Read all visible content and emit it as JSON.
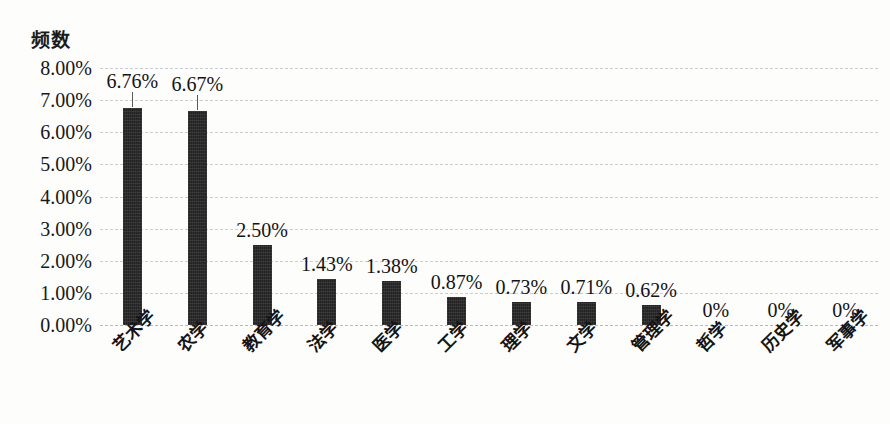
{
  "chart_data": {
    "type": "bar",
    "title": "",
    "ylabel": "频数",
    "xlabel": "",
    "ylim": [
      0,
      8
    ],
    "ytick_labels": [
      "8.00%",
      "7.00%",
      "6.00%",
      "5.00%",
      "4.00%",
      "3.00%",
      "2.00%",
      "1.00%",
      "0.00%"
    ],
    "ytick_values": [
      8,
      7,
      6,
      5,
      4,
      3,
      2,
      1,
      0
    ],
    "grid": true,
    "grid_style": "dashed-horizontal",
    "legend": "none",
    "bar_color": "#232323",
    "categories": [
      "艺术学",
      "农学",
      "教育学",
      "法学",
      "医学",
      "工学",
      "理学",
      "文学",
      "管理学",
      "哲学",
      "历史学",
      "军事学"
    ],
    "values": [
      6.76,
      6.67,
      2.5,
      1.43,
      1.38,
      0.87,
      0.73,
      0.71,
      0.62,
      0,
      0,
      0
    ],
    "data_labels": [
      "6.76%",
      "6.67%",
      "2.50%",
      "1.43%",
      "1.38%",
      "0.87%",
      "0.73%",
      "0.71%",
      "0.62%",
      "0%",
      "0%",
      "0%"
    ]
  }
}
